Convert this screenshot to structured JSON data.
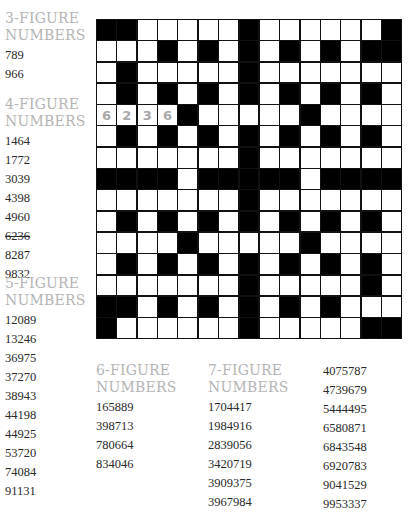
{
  "puzzle": {
    "grid": [
      "BBWWWWWBWWWWWWB",
      "WWWBWBWBWBWBWBB",
      "WBWWWWWBWWWWWWW",
      "WBWBWBWBWBWBWBW",
      "WWWWBWWWWWBWWWW",
      "WBWBWBWBWBWBWBW",
      "WWWWWWWBWWWWWWW",
      "BBBBWBBBBBWBBBB",
      "WWWWWWWBWWWWWWW",
      "WBWBWBWBWBWBWBW",
      "WWWWBWWWWWBWWWW",
      "WBWBWBWBWBWBWBW",
      "WWWWWWWBWWWWWBW",
      "BBWBWBWBWBWBWWW",
      "BWWWWWWBWWWWWBB"
    ],
    "filled": [
      {
        "row": 4,
        "col": 0,
        "digit": "6"
      },
      {
        "row": 4,
        "col": 1,
        "digit": "2"
      },
      {
        "row": 4,
        "col": 2,
        "digit": "3"
      },
      {
        "row": 4,
        "col": 3,
        "digit": "6"
      }
    ]
  },
  "lists": {
    "three": {
      "heading1": "3-FIGURE",
      "heading2": "NUMBERS",
      "items": [
        "789",
        "966"
      ]
    },
    "four": {
      "heading1": "4-FIGURE",
      "heading2": "NUMBERS",
      "items": [
        "1464",
        "1772",
        "3039",
        "4398",
        "4960",
        "6236",
        "8287",
        "9832"
      ],
      "struck": [
        "6236"
      ]
    },
    "five": {
      "heading1": "5-FIGURE",
      "heading2": "NUMBERS",
      "items": [
        "12089",
        "13246",
        "36975",
        "37270",
        "38943",
        "44198",
        "44925",
        "53720",
        "74084",
        "91131"
      ]
    },
    "six": {
      "heading1": "6-FIGURE",
      "heading2": "NUMBERS",
      "items": [
        "165889",
        "398713",
        "780664",
        "834046"
      ]
    },
    "seven": {
      "heading1": "7-FIGURE",
      "heading2": "NUMBERS",
      "items": [
        "1704417",
        "1984916",
        "2839056",
        "3420719",
        "3909375",
        "3967984"
      ]
    },
    "seven_cont": {
      "items": [
        "4075787",
        "4739679",
        "5444495",
        "6580871",
        "6843548",
        "6920783",
        "9041529",
        "9953337"
      ]
    }
  },
  "colors": {
    "heading": "#b4b4b4",
    "filled_digit": "#a8a8a8",
    "black_cell": "#000000"
  }
}
